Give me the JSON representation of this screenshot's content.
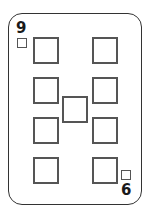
{
  "card": {
    "top_left_rank": "9",
    "bottom_right_rank": "6",
    "suit_icon": "square",
    "pip_count": 9,
    "colors": {
      "border": "#333333",
      "pip_border": "#555555",
      "rank": "#1a1a1a",
      "background": "#ffffff"
    }
  }
}
